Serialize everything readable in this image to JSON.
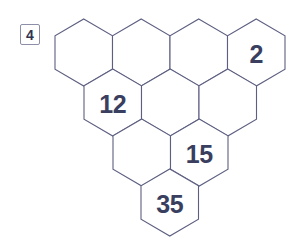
{
  "badge": {
    "label": "4"
  },
  "puzzle": {
    "name": "hexagon-pyramid",
    "stroke_color": "#5d5f80",
    "text_color": "#3a3f5f",
    "background_color": "#ffffff",
    "rows": [
      {
        "row_index": 1,
        "cells": [
          {
            "id": "r1c1",
            "value": ""
          },
          {
            "id": "r1c2",
            "value": ""
          },
          {
            "id": "r1c3",
            "value": ""
          },
          {
            "id": "r1c4",
            "value": "2"
          }
        ]
      },
      {
        "row_index": 2,
        "cells": [
          {
            "id": "r2c1",
            "value": "12"
          },
          {
            "id": "r2c2",
            "value": ""
          },
          {
            "id": "r2c3",
            "value": ""
          }
        ]
      },
      {
        "row_index": 3,
        "cells": [
          {
            "id": "r3c1",
            "value": ""
          },
          {
            "id": "r3c2",
            "value": "15"
          }
        ]
      },
      {
        "row_index": 4,
        "cells": [
          {
            "id": "r4c1",
            "value": "35"
          }
        ]
      }
    ]
  },
  "geometry": {
    "hex_width": 57.5,
    "hex_height": 67,
    "row_pitch": 50,
    "row_starts_x": [
      55,
      84,
      113,
      141
    ],
    "row_tops_y": [
      19,
      69,
      119,
      169
    ]
  }
}
